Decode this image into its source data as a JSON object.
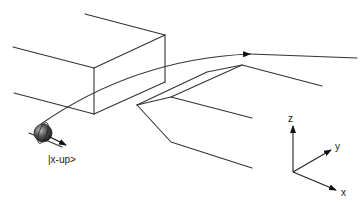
{
  "diagram": {
    "state_label": "|x-up>",
    "axes": {
      "z_label": "z",
      "y_label": "y",
      "x_label": "x"
    },
    "colors": {
      "line": "#333333",
      "sphere_dark": "#2a2a2a",
      "sphere_light": "#9a9a9a",
      "background": "#ffffff"
    }
  }
}
